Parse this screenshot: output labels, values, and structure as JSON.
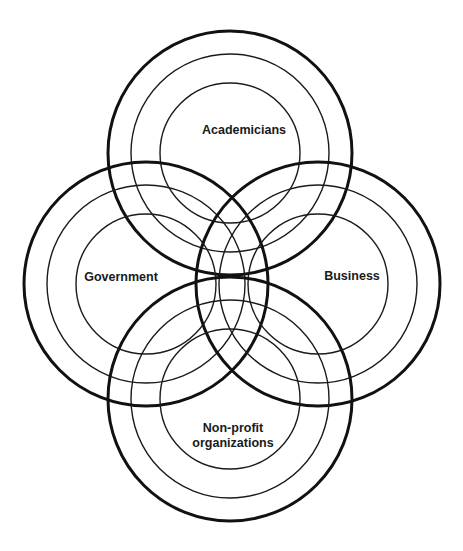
{
  "diagram": {
    "type": "overlapping-concentric-circles",
    "stroke_color": "#111111",
    "background": "#ffffff",
    "ring_radii": [
      122,
      99,
      70
    ],
    "groups": [
      {
        "id": "academicians",
        "label_lines": [
          "Academicians"
        ],
        "center": [
          230,
          153
        ],
        "label_pos": [
          244,
          134
        ]
      },
      {
        "id": "government",
        "label_lines": [
          "Government"
        ],
        "center": [
          146,
          284
        ],
        "label_pos": [
          121,
          281
        ]
      },
      {
        "id": "business",
        "label_lines": [
          "Business"
        ],
        "center": [
          318,
          284
        ],
        "label_pos": [
          352,
          280
        ]
      },
      {
        "id": "non-profit",
        "label_lines": [
          "Non-profit",
          "organizations"
        ],
        "center": [
          230,
          399
        ],
        "label_pos": [
          233,
          432
        ]
      }
    ]
  }
}
